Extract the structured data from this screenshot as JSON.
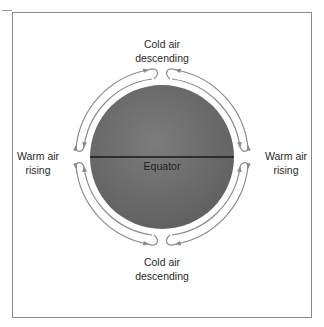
{
  "diagram": {
    "top_label": {
      "line1": "Cold air",
      "line2": "descending"
    },
    "bottom_label": {
      "line1": "Cold air",
      "line2": "descending"
    },
    "left_label": {
      "line1": "Warm air",
      "line2": "rising"
    },
    "right_label": {
      "line1": "Warm air",
      "line2": "rising"
    },
    "equator_label": "Equator"
  },
  "colors": {
    "globe": "#6f6f6f",
    "equator_line": "#1a1a1a",
    "arrows": "#8c8c8c",
    "frame": "#8a8a8a"
  }
}
